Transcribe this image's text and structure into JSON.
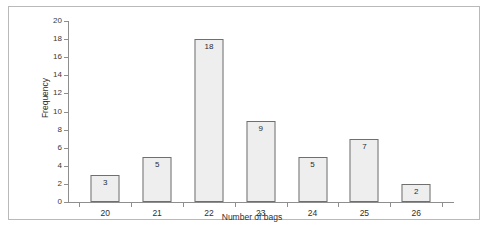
{
  "chart_data": {
    "type": "bar",
    "title": "",
    "xlabel": "Number of bags",
    "ylabel": "Frequency",
    "categories": [
      "20",
      "21",
      "22",
      "23",
      "24",
      "25",
      "26"
    ],
    "values": [
      3,
      5,
      18,
      9,
      5,
      7,
      2
    ],
    "ylim": [
      0,
      20
    ],
    "ytick_step": 2,
    "yticks": [
      "0",
      "2",
      "4",
      "6",
      "8",
      "10",
      "12",
      "14",
      "16",
      "18",
      "20"
    ],
    "grid": false,
    "legend": null,
    "bar_fill_color": "#eeeeee",
    "bar_border_color": "#6f6f6f",
    "axis_color": "#8e8e8e",
    "show_value_labels": true
  },
  "figure": {
    "border_color": "#b9b9b9",
    "background": "#ffffff"
  },
  "caption": {
    "text": ""
  }
}
